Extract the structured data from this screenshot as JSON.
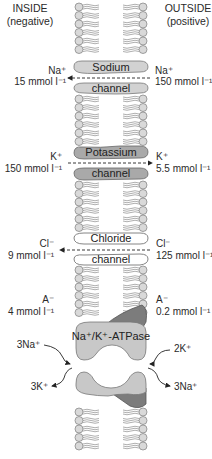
{
  "header": {
    "inside_title": "INSIDE",
    "inside_sub": "(negative)",
    "outside_title": "OUTSIDE",
    "outside_sub": "(positive)"
  },
  "colors": {
    "membrane_head": "#d9d9d9",
    "membrane_stroke": "#8a8a8a",
    "sodium_channel": "#d2d2d2",
    "potassium_channel": "#a9a9a9",
    "chloride_channel": "#ffffff",
    "atpase_light": "#c8c8c8",
    "atpase_dark": "#7c7c7c"
  },
  "channels": [
    {
      "id": "sodium",
      "top_label": "Sodium",
      "bottom_label": "channel",
      "inside_ion": "Na⁺",
      "inside_conc": "15 mmol l⁻¹",
      "outside_ion": "Na⁺",
      "outside_conc": "150 mmol l⁻¹",
      "flow_direction": "inward"
    },
    {
      "id": "potassium",
      "top_label": "Potassium",
      "bottom_label": "channel",
      "inside_ion": "K⁺",
      "inside_conc": "150 mmol l⁻¹",
      "outside_ion": "K⁺",
      "outside_conc": "5.5 mmol l⁻¹",
      "flow_direction": "outward"
    },
    {
      "id": "chloride",
      "top_label": "Chloride",
      "bottom_label": "channel",
      "inside_ion": "Cl⁻",
      "inside_conc": "9 mmol l⁻¹",
      "outside_ion": "Cl⁻",
      "outside_conc": "125 mmol l⁻¹",
      "flow_direction": "inward"
    }
  ],
  "anions": {
    "inside_ion": "A⁻",
    "inside_conc": "4 mmol l⁻¹",
    "outside_ion": "A⁻",
    "outside_conc": "0.2 mmol l⁻¹"
  },
  "pump": {
    "label": "Na⁺/K⁺-ATPase",
    "in_left": "3Na⁺",
    "in_right": "2K⁺",
    "out_left": "3K⁺",
    "out_right": "3Na⁺"
  }
}
